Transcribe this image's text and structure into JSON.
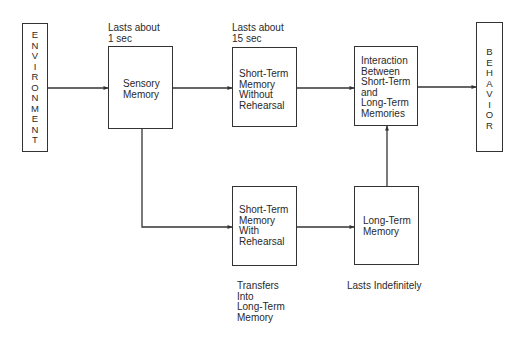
{
  "diagram": {
    "type": "flowchart",
    "title": "",
    "nodes": {
      "environment": {
        "label": "E\nN\nV\nI\nR\nO\nN\nM\nE\nN\nT"
      },
      "sensory": {
        "label": "Sensory\nMemory"
      },
      "stm_without": {
        "label": "Short-Term\nMemory\nWithout\nRehearsal"
      },
      "interaction": {
        "label": "Interaction\nBetween\nShort-Term\nand\nLong-Term\nMemories"
      },
      "behavior": {
        "label": "B\nE\nH\nA\nV\nI\nO\nR"
      },
      "stm_with": {
        "label": "Short-Term\nMemory\nWith\nRehearsal"
      },
      "long_term": {
        "label": "Long-Term\nMemory"
      }
    },
    "annotations": {
      "sensory_duration": "Lasts about\n1 sec",
      "stm_duration": "Lasts about\n15 sec",
      "stm_with_note": "Transfers\nInto\nLong-Term\nMemory",
      "long_term_duration": "Lasts Indefinitely"
    },
    "edges": [
      {
        "from": "Environment",
        "to": "Sensory Memory"
      },
      {
        "from": "Sensory Memory",
        "to": "Short-Term Memory Without Rehearsal"
      },
      {
        "from": "Short-Term Memory Without Rehearsal",
        "to": "Interaction Between Short-Term and Long-Term Memories"
      },
      {
        "from": "Interaction Between Short-Term and Long-Term Memories",
        "to": "Behavior"
      },
      {
        "from": "Sensory Memory",
        "to": "Short-Term Memory With Rehearsal"
      },
      {
        "from": "Short-Term Memory With Rehearsal",
        "to": "Long-Term Memory"
      },
      {
        "from": "Long-Term Memory",
        "to": "Interaction Between Short-Term and Long-Term Memories"
      }
    ],
    "colors": {
      "line": "#333333",
      "text": "#2a2a2a",
      "background": "#ffffff"
    }
  }
}
